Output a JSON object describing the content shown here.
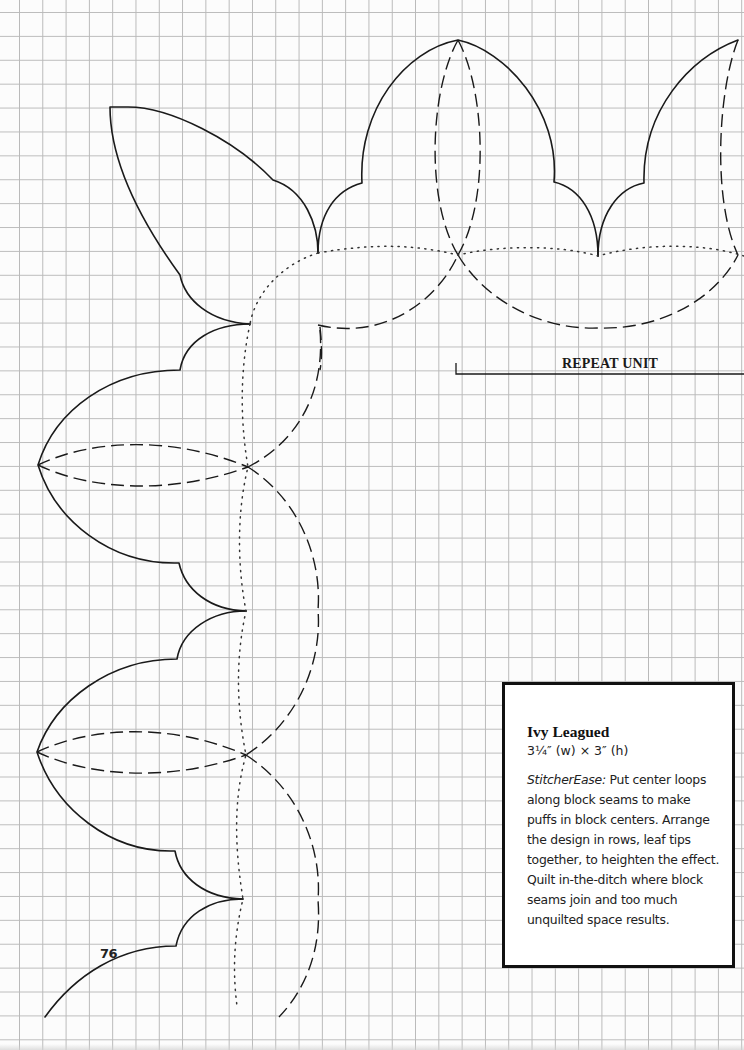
{
  "page": {
    "grid_color": "#bdbdbd",
    "page_number": "76"
  },
  "pattern": {
    "repeat_label": "REPEAT UNIT",
    "line_styles": [
      "solid-outline",
      "dashed-quilt-line",
      "dotted-seam-line"
    ]
  },
  "info_box": {
    "title": "Ivy Leagued",
    "size": "3¼″ (w) × 3″ (h)",
    "body_lead": "StitcherEase:",
    "body_text": " Put center loops along block seams to make puffs in block centers. Arrange the design in rows, leaf tips together, to heighten the effect. Quilt in-the-ditch where block seams join and too much unquilted space results."
  }
}
